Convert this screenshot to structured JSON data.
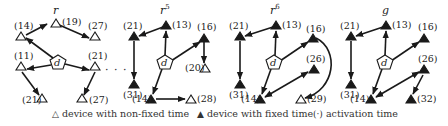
{
  "colors": {
    "stroke": "#1a1a1a",
    "fill_fixed": "#1a1a1a",
    "fill_nonfixed": "#ffffff",
    "background": "#ffffff"
  },
  "panels": [
    {
      "title": "r",
      "title_sup": "",
      "depot_label": "d",
      "nodes": [
        {
          "id": "p1n19",
          "label": "(19)",
          "fixed": false
        },
        {
          "id": "p1n14",
          "label": "(14)",
          "fixed": false
        },
        {
          "id": "p1n27a",
          "label": "(27)",
          "fixed": false
        },
        {
          "id": "p1n11",
          "label": "(11)",
          "fixed": false
        },
        {
          "id": "p1n21a",
          "label": "(21)",
          "fixed": false
        },
        {
          "id": "p1n21b",
          "label": "(21)",
          "fixed": false
        },
        {
          "id": "p1n27b",
          "label": "(27)",
          "fixed": false
        }
      ]
    },
    {
      "title": "r",
      "title_sup": "5",
      "depot_label": "d",
      "nodes": [
        {
          "id": "p2n13",
          "label": "(13)",
          "fixed": true
        },
        {
          "id": "p2n21",
          "label": "(21)",
          "fixed": true
        },
        {
          "id": "p2n31",
          "label": "(31)",
          "fixed": true
        },
        {
          "id": "p2n16",
          "label": "(16)",
          "fixed": true
        },
        {
          "id": "p2n20",
          "label": "(20)",
          "fixed": false
        },
        {
          "id": "p2n14",
          "label": "(14)",
          "fixed": true
        },
        {
          "id": "p2n28",
          "label": "(28)",
          "fixed": false
        }
      ]
    },
    {
      "title": "r",
      "title_sup": "6",
      "depot_label": "d",
      "nodes": [
        {
          "id": "p3n13",
          "label": "(13)",
          "fixed": true
        },
        {
          "id": "p3n21",
          "label": "(21)",
          "fixed": true
        },
        {
          "id": "p3n31",
          "label": "(31)",
          "fixed": true
        },
        {
          "id": "p3n16",
          "label": "(16)",
          "fixed": true
        },
        {
          "id": "p3n26",
          "label": "(26)",
          "fixed": true
        },
        {
          "id": "p3n14",
          "label": "(14)",
          "fixed": true
        },
        {
          "id": "p3n29",
          "label": "(29)",
          "fixed": false
        }
      ]
    },
    {
      "title": "g",
      "title_sup": "",
      "depot_label": "d",
      "nodes": [
        {
          "id": "p4n13",
          "label": "(13)",
          "fixed": true
        },
        {
          "id": "p4n21",
          "label": "(21)",
          "fixed": true
        },
        {
          "id": "p4n31",
          "label": "(31)",
          "fixed": true
        },
        {
          "id": "p4n16",
          "label": "(16)",
          "fixed": true
        },
        {
          "id": "p4n26",
          "label": "(26)",
          "fixed": true
        },
        {
          "id": "p4n14",
          "label": "(14)",
          "fixed": true
        },
        {
          "id": "p4n32",
          "label": "(32)",
          "fixed": true
        }
      ]
    }
  ],
  "ellipsis": "· · ·",
  "legend": {
    "nonfixed_glyph": "△",
    "nonfixed_text": "device with non-fixed time",
    "fixed_glyph": "▲",
    "fixed_text": "device with fixed time",
    "activation_glyph": "(·)",
    "activation_text": "activation time"
  }
}
